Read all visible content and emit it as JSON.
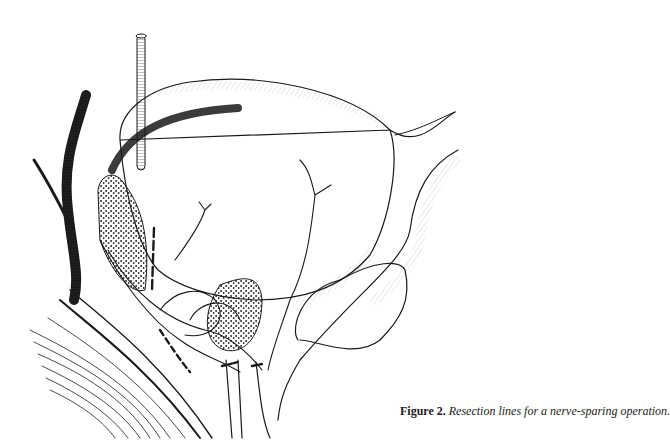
{
  "figure": {
    "label": "Figure 2.",
    "caption": " Resection lines for a nerve-sparing operation.",
    "illustration": "anatomical-line-drawing-pelvic-organs-with-neurovascular-bundle-and-resection-lines",
    "colors": {
      "ink": "#1a1a1a",
      "background": "#ffffff"
    }
  }
}
